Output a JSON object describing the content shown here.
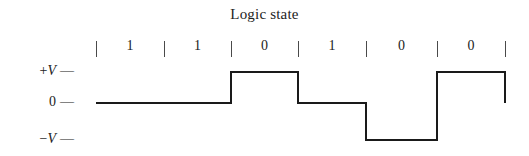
{
  "chart_data": {
    "type": "line",
    "title": "Logic state",
    "xlabel": "",
    "ylabel": "",
    "grid": false,
    "legend_position": "none",
    "y_tick_labels": [
      "+V",
      "0",
      "−V"
    ],
    "y_levels": [
      1,
      0,
      -1
    ],
    "categories": [
      "1",
      "1",
      "0",
      "1",
      "0",
      "0"
    ],
    "values": [
      0,
      0,
      1,
      0,
      -1,
      1
    ],
    "encoding_note": "bipolar return-to-zero style level waveform",
    "series": [
      {
        "name": "signal",
        "points": [
          {
            "bit_index": 0,
            "bit": "1",
            "level": 0
          },
          {
            "bit_index": 1,
            "bit": "1",
            "level": 0
          },
          {
            "bit_index": 2,
            "bit": "0",
            "level": 1
          },
          {
            "bit_index": 3,
            "bit": "1",
            "level": 0
          },
          {
            "bit_index": 4,
            "bit": "0",
            "level": -1
          },
          {
            "bit_index": 5,
            "bit": "0",
            "level": 1
          }
        ]
      }
    ],
    "boundary_ticks": [
      96,
      164,
      231,
      298,
      366,
      437,
      505
    ],
    "line_color": "#1a1a1a",
    "background_color": "#ffffff"
  },
  "axis": {
    "plus_v": {
      "sign": "+",
      "symbol": "V",
      "dash": "—"
    },
    "zero": {
      "sign": "",
      "symbol": "0",
      "dash": "—"
    },
    "minus_v": {
      "sign": "−",
      "symbol": "V",
      "dash": "—"
    }
  },
  "title": "Logic state"
}
